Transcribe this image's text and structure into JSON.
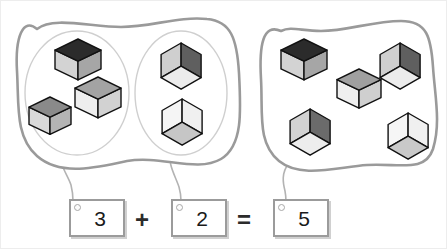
{
  "canvas": {
    "width": 447,
    "height": 249,
    "background": "#ffffff",
    "border_color": "#ededed"
  },
  "task": {
    "type": "cube-counting-addition",
    "equation_text": "3 + 2 = 5"
  },
  "palette": {
    "blob_stroke": "#9a9a9a",
    "oval_stroke": "#cfcfcf",
    "connector_stroke": "#b3b3b3",
    "box_border": "#9b9b9b",
    "box_fill": "#ffffff",
    "box_shadow": "#aaaaaa",
    "text": "#1a1a1a",
    "cube_outline": "#111111",
    "cube_top_dark": "#2b2b2b",
    "cube_top_mid": "#8f8f8f",
    "cube_top_light": "#c9c9c9",
    "cube_left_light": "#d8d8d8",
    "cube_left_white": "#f2f2f2",
    "cube_right_mid": "#a8a8a8",
    "cube_right_light": "#cccccc",
    "cube_right_white": "#ededed"
  },
  "groups": [
    {
      "id": "left-blob",
      "label": "left-outer-group",
      "path": "M 36 28 C 22 16, 14 36, 16 70 C 18 104, 14 136, 36 155 C 60 176, 96 166, 126 160 C 160 154, 196 172, 220 158 C 242 145, 240 110, 238 72 C 236 38, 230 20, 206 18 C 178 15, 150 26, 120 26 C 90 26, 52 15, 36 28 Z",
      "ovals": [
        {
          "id": "oval-a",
          "label": "oval-group-3",
          "cx": 76,
          "cy": 92,
          "rx": 52,
          "ry": 62,
          "count": 3
        },
        {
          "id": "oval-b",
          "label": "oval-group-2",
          "cx": 180,
          "cy": 92,
          "rx": 46,
          "ry": 62,
          "count": 2
        }
      ]
    },
    {
      "id": "right-blob",
      "label": "right-outer-group",
      "path": "M 280 30 C 262 22, 258 44, 260 78 C 262 112, 256 142, 278 160 C 300 178, 336 166, 366 164 C 398 162, 424 172, 432 148 C 440 122, 434 96, 432 66 C 430 36, 426 20, 400 20 C 372 20, 346 30, 320 30 C 300 30, 290 25, 280 30 Z",
      "count": 5
    }
  ],
  "cubes": [
    {
      "group": "oval-a",
      "x": 54,
      "y": 38,
      "size": 23,
      "style": "top",
      "top": "#2b2b2b",
      "left": "#d3d3d3",
      "right": "#a6a6a6"
    },
    {
      "group": "oval-a",
      "x": 74,
      "y": 76,
      "size": 23,
      "style": "top",
      "top": "#a3a3a3",
      "left": "#eeeeee",
      "right": "#d2d2d2"
    },
    {
      "group": "oval-a",
      "x": 28,
      "y": 96,
      "size": 21,
      "style": "top",
      "top": "#8a8a8a",
      "left": "#d9d9d9",
      "right": "#b4b4b4"
    },
    {
      "group": "oval-b",
      "x": 157,
      "y": 42,
      "size": 22,
      "style": "hex",
      "top": "#5f5f5f",
      "left": "#cfcfcf",
      "right": "#ececec"
    },
    {
      "group": "oval-b",
      "x": 158,
      "y": 98,
      "size": 22,
      "style": "hex",
      "top": "#f0f0f0",
      "left": "#f5f5f5",
      "right": "#c6c6c6"
    },
    {
      "group": "right-blob",
      "x": 280,
      "y": 38,
      "size": 23,
      "style": "top",
      "top": "#2b2b2b",
      "left": "#d3d3d3",
      "right": "#a6a6a6"
    },
    {
      "group": "right-blob",
      "x": 336,
      "y": 68,
      "size": 22,
      "style": "top",
      "top": "#a0a0a0",
      "left": "#efefef",
      "right": "#cfcfcf"
    },
    {
      "group": "right-blob",
      "x": 376,
      "y": 42,
      "size": 22,
      "style": "hex",
      "top": "#5f5f5f",
      "left": "#cfcfcf",
      "right": "#ececec"
    },
    {
      "group": "right-blob",
      "x": 286,
      "y": 108,
      "size": 22,
      "style": "hex",
      "top": "#6b6b6b",
      "left": "#d2d2d2",
      "right": "#ededed"
    },
    {
      "group": "right-blob",
      "x": 384,
      "y": 112,
      "size": 22,
      "style": "hex",
      "top": "#f0f0f0",
      "left": "#f6f6f6",
      "right": "#c9c9c9"
    }
  ],
  "connectors": [
    {
      "id": "conn-1",
      "from": "oval-a",
      "to": "box-1",
      "path": "M 62 150 C 56 162, 66 172, 70 184 C 72 192, 72 196, 72 200"
    },
    {
      "id": "conn-2",
      "from": "oval-b",
      "to": "box-2",
      "path": "M 170 150 C 166 162, 174 174, 178 186 C 180 193, 180 197, 180 200"
    },
    {
      "id": "conn-3",
      "from": "right-blob",
      "to": "box-3",
      "path": "M 288 162 C 280 172, 282 182, 284 190 C 285 195, 285 198, 285 201"
    }
  ],
  "equation": {
    "box_1": {
      "id": "box-1",
      "value": "3",
      "left": 68,
      "top": 198,
      "width": 56,
      "height": 38
    },
    "operator_plus": {
      "symbol": "+",
      "left": 134,
      "top": 207
    },
    "box_2": {
      "id": "box-2",
      "value": "2",
      "left": 170,
      "top": 198,
      "width": 56,
      "height": 38
    },
    "operator_equals": {
      "symbol": "=",
      "left": 236,
      "top": 207
    },
    "box_3": {
      "id": "box-3",
      "value": "5",
      "left": 272,
      "top": 198,
      "width": 56,
      "height": 38
    }
  }
}
